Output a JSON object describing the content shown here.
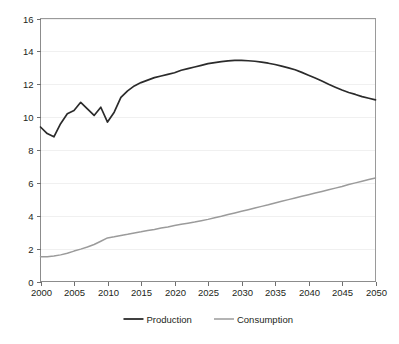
{
  "chart_data": {
    "type": "line",
    "title": "",
    "subtitle": "",
    "xlabel": "",
    "ylabel": "",
    "xlim": [
      2000,
      2050
    ],
    "ylim": [
      0,
      16
    ],
    "grid": true,
    "legend_position": "bottom",
    "x_ticks": [
      "2000",
      "2005",
      "2010",
      "2015",
      "2020",
      "2025",
      "2030",
      "2035",
      "2040",
      "2045",
      "2050"
    ],
    "y_ticks": [
      "0",
      "2",
      "4",
      "6",
      "8",
      "10",
      "12",
      "14",
      "16"
    ],
    "x": [
      2000,
      2001,
      2002,
      2003,
      2004,
      2005,
      2006,
      2007,
      2008,
      2009,
      2010,
      2011,
      2012,
      2013,
      2014,
      2015,
      2016,
      2017,
      2018,
      2019,
      2020,
      2021,
      2022,
      2023,
      2024,
      2025,
      2026,
      2027,
      2028,
      2029,
      2030,
      2031,
      2032,
      2033,
      2034,
      2035,
      2036,
      2037,
      2038,
      2039,
      2040,
      2041,
      2042,
      2043,
      2044,
      2045,
      2046,
      2047,
      2048,
      2049,
      2050
    ],
    "series": [
      {
        "name": "Production",
        "color": "#2b2b2b",
        "width": 1.7,
        "values": [
          9.4,
          9.0,
          8.8,
          9.6,
          10.2,
          10.4,
          10.9,
          10.5,
          10.1,
          10.6,
          9.7,
          10.3,
          11.2,
          11.6,
          11.9,
          12.1,
          12.25,
          12.4,
          12.5,
          12.6,
          12.7,
          12.85,
          12.95,
          13.05,
          13.15,
          13.25,
          13.32,
          13.38,
          13.42,
          13.45,
          13.45,
          13.43,
          13.4,
          13.35,
          13.28,
          13.2,
          13.1,
          13.0,
          12.88,
          12.72,
          12.55,
          12.38,
          12.2,
          12.0,
          11.82,
          11.65,
          11.5,
          11.38,
          11.25,
          11.15,
          11.05
        ]
      },
      {
        "name": "Consumption",
        "color": "#9b9b9b",
        "width": 1.5,
        "values": [
          1.5,
          1.5,
          1.55,
          1.62,
          1.72,
          1.85,
          1.97,
          2.1,
          2.25,
          2.45,
          2.65,
          2.72,
          2.8,
          2.87,
          2.95,
          3.02,
          3.1,
          3.17,
          3.25,
          3.32,
          3.4,
          3.48,
          3.55,
          3.62,
          3.7,
          3.78,
          3.88,
          3.97,
          4.07,
          4.17,
          4.27,
          4.37,
          4.47,
          4.57,
          4.67,
          4.78,
          4.88,
          4.98,
          5.08,
          5.18,
          5.28,
          5.38,
          5.48,
          5.58,
          5.68,
          5.78,
          5.9,
          6.0,
          6.1,
          6.2,
          6.3
        ]
      }
    ],
    "legend": [
      {
        "label": "Production",
        "color": "#2b2b2b",
        "width": 1.8
      },
      {
        "label": "Consumption",
        "color": "#9b9b9b",
        "width": 1.5
      }
    ]
  }
}
